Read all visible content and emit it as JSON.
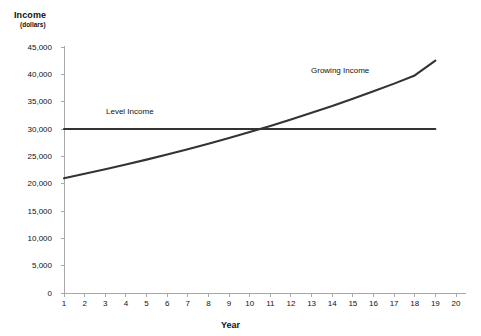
{
  "chart_data": {
    "type": "line",
    "title": "",
    "ylabel": "Income",
    "ylabel_units": "(dollars)",
    "xlabel": "Year",
    "xlim": [
      1,
      20
    ],
    "ylim": [
      0,
      45000
    ],
    "grid": false,
    "legend_position": "inline-annotations",
    "x": [
      1,
      2,
      3,
      4,
      5,
      6,
      7,
      8,
      9,
      10,
      11,
      12,
      13,
      14,
      15,
      16,
      17,
      18,
      19
    ],
    "xtick_labels": [
      "1",
      "2",
      "3",
      "4",
      "5",
      "6",
      "7",
      "8",
      "9",
      "10",
      "11",
      "12",
      "13",
      "14",
      "15",
      "16",
      "17",
      "18",
      "19",
      "20"
    ],
    "xticks": [
      1,
      2,
      3,
      4,
      5,
      6,
      7,
      8,
      9,
      10,
      11,
      12,
      13,
      14,
      15,
      16,
      17,
      18,
      19,
      20
    ],
    "ytick_labels": [
      "0",
      "5,000",
      "10,000",
      "15,000",
      "20,000",
      "25,000",
      "30,000",
      "35,000",
      "40,000",
      "45,000"
    ],
    "yticks": [
      0,
      5000,
      10000,
      15000,
      20000,
      25000,
      30000,
      35000,
      40000,
      45000
    ],
    "series": [
      {
        "name": "Level Income",
        "annotation": "Level Income",
        "color": "#333333",
        "values": [
          30000,
          30000,
          30000,
          30000,
          30000,
          30000,
          30000,
          30000,
          30000,
          30000,
          30000,
          30000,
          30000,
          30000,
          30000,
          30000,
          30000,
          30000,
          30000
        ]
      },
      {
        "name": "Growing Income",
        "annotation": "Growing Income",
        "color": "#333333",
        "values": [
          21000,
          21800,
          22650,
          23500,
          24400,
          25350,
          26300,
          27300,
          28350,
          29450,
          30550,
          31750,
          32950,
          34200,
          35550,
          36900,
          38300,
          39800,
          42500
        ]
      }
    ],
    "axis_color": "#a8a8a8",
    "background_color": "#ffffff"
  },
  "annotations": {
    "level_income": "Level Income",
    "growing_income": "Growing Income"
  }
}
